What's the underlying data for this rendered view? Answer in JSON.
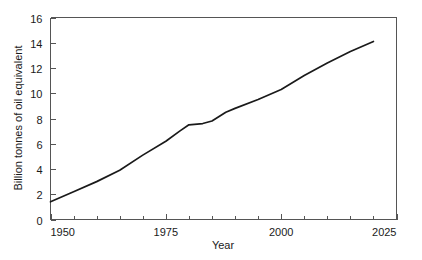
{
  "chart_data": {
    "type": "line",
    "title": "",
    "xlabel": "Year",
    "ylabel": "Billion tonnes of oil equivalent",
    "xlim": [
      1950,
      2025
    ],
    "ylim": [
      0,
      16
    ],
    "grid": false,
    "legend": null,
    "x_major_ticks": [
      1950,
      1975,
      2000,
      2025
    ],
    "x_major_tick_labels": [
      "1950",
      "1975",
      "2000",
      "2025"
    ],
    "x_minor_tick_step": 5,
    "y_major_ticks": [
      0,
      2,
      4,
      6,
      8,
      10,
      12,
      14,
      16
    ],
    "y_major_tick_labels": [
      "0",
      "2",
      "4",
      "6",
      "8",
      "10",
      "12",
      "14",
      "16"
    ],
    "series": [
      {
        "name": "World primary energy consumption",
        "color": "#1a1a1a",
        "x": [
          1950,
          1955,
          1960,
          1965,
          1970,
          1975,
          1978,
          1980,
          1983,
          1985,
          1988,
          1990,
          1995,
          2000,
          2005,
          2010,
          2015,
          2020
        ],
        "values": [
          1.4,
          2.2,
          3.0,
          3.9,
          5.1,
          6.2,
          7.0,
          7.5,
          7.6,
          7.8,
          8.5,
          8.8,
          9.5,
          10.3,
          11.4,
          12.4,
          13.3,
          14.1
        ]
      }
    ]
  },
  "axes": {
    "x_axis_name": "year-axis",
    "y_axis_name": "energy-axis"
  }
}
